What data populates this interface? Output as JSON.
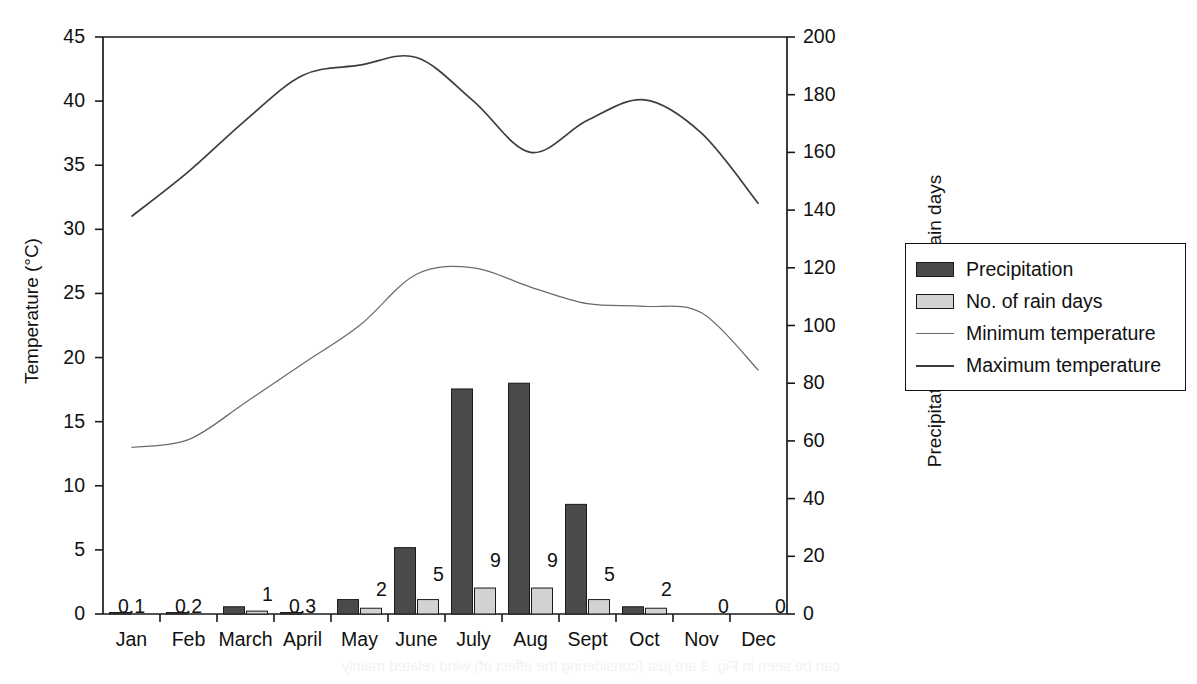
{
  "chart_data": {
    "type": "bar",
    "title": "",
    "subtitle": "",
    "categories": [
      "Jan",
      "Feb",
      "March",
      "April",
      "May",
      "June",
      "July",
      "Aug",
      "Sept",
      "Oct",
      "Nov",
      "Dec"
    ],
    "xlabel": "",
    "grid": false,
    "legend_position": "right",
    "axes": {
      "left": {
        "label": "Temperature (°C)",
        "ticks": [
          0,
          5,
          10,
          15,
          20,
          25,
          30,
          35,
          40,
          45
        ],
        "range": [
          0,
          45
        ],
        "units": "°C"
      },
      "right": {
        "label": "Precipitation (mm)/No. of rain days",
        "ticks": [
          0,
          20,
          40,
          60,
          80,
          100,
          120,
          140,
          160,
          180,
          200
        ],
        "range": [
          0,
          200
        ],
        "units": "mm"
      }
    },
    "series": [
      {
        "name": "Precipitation",
        "kind": "bar",
        "axis": "right",
        "units": "mm",
        "color": "#4a4a4a",
        "values": [
          0.1,
          0.2,
          1,
          0.3,
          2,
          5,
          9,
          9,
          5,
          2,
          0,
          0
        ],
        "bar_mm": [
          0.1,
          0.2,
          2.5,
          0.3,
          5,
          23,
          78,
          80,
          38,
          2.5,
          0,
          0
        ],
        "data_labels": [
          "0.1",
          "0.2",
          "1",
          "0.3",
          "2",
          "5",
          "9",
          "9",
          "5",
          "2",
          "0",
          "0"
        ]
      },
      {
        "name": "No. of rain days",
        "kind": "bar",
        "axis": "right",
        "units": "days",
        "color": "#d2d2d2",
        "values": [
          0,
          0,
          1,
          0,
          2,
          5,
          9,
          9,
          5,
          2,
          0,
          0
        ]
      },
      {
        "name": "Minimum temperature",
        "kind": "line",
        "axis": "left",
        "units": "°C",
        "color": "#6b6b6b",
        "values": [
          13,
          13.6,
          16.5,
          19.5,
          22.5,
          26.5,
          27,
          25.5,
          24.2,
          24,
          23.5,
          19
        ]
      },
      {
        "name": "Maximum temperature",
        "kind": "line",
        "axis": "left",
        "units": "°C",
        "color": "#3d3d3d",
        "values": [
          31,
          34.5,
          38.5,
          42,
          42.8,
          43.4,
          40,
          36,
          38.5,
          40.1,
          37.5,
          32
        ]
      }
    ]
  },
  "legend": {
    "items": [
      {
        "label": "Precipitation",
        "swatch": "dark-bar-swatch"
      },
      {
        "label": "No. of rain days",
        "swatch": "light-bar-swatch"
      },
      {
        "label": "Minimum temperature",
        "swatch": "thin-line-swatch"
      },
      {
        "label": "Maximum temperature",
        "swatch": "thick-line-swatch"
      }
    ]
  },
  "artifact": {
    "bleed_text": "can be seen in Fig. 3 are just (considering the effect of) wind related mainly"
  }
}
